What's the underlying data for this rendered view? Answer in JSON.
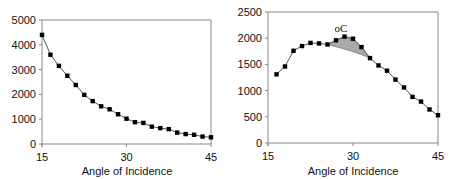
{
  "chart_data": [
    {
      "type": "line",
      "title": "",
      "xlabel": "Angle of Incidence",
      "ylabel": "",
      "xlim": [
        15,
        45
      ],
      "ylim": [
        0,
        5000
      ],
      "xticks": [
        15,
        30,
        45
      ],
      "yticks": [
        0,
        1000,
        2000,
        3000,
        4000,
        5000
      ],
      "grid": false,
      "legend": null,
      "x": [
        15,
        16.5,
        18,
        19.5,
        21,
        22.5,
        24,
        25.5,
        27,
        28.5,
        30,
        31.5,
        33,
        34.5,
        36,
        37.5,
        39,
        40.5,
        42,
        43.5,
        45
      ],
      "values": [
        4400,
        3600,
        3150,
        2750,
        2380,
        1980,
        1730,
        1520,
        1400,
        1200,
        1020,
        880,
        850,
        700,
        640,
        600,
        460,
        400,
        370,
        300,
        270
      ]
    },
    {
      "type": "line",
      "title": "",
      "xlabel": "Angle of Incidence",
      "ylabel": "",
      "xlim": [
        15,
        45
      ],
      "ylim": [
        0,
        2500
      ],
      "xticks": [
        15,
        30,
        45
      ],
      "yticks": [
        0,
        500,
        1000,
        1500,
        2000,
        2500
      ],
      "grid": false,
      "legend": null,
      "annotations": [
        {
          "text": "oC",
          "x": 29.5,
          "y": 2200,
          "note": "shaded region between curve and baseline from ~25.5 to ~33"
        }
      ],
      "x": [
        16.5,
        18,
        19.5,
        21,
        22.5,
        24,
        25.5,
        27,
        28.5,
        30,
        31.5,
        33,
        34.5,
        36,
        37.5,
        39,
        40.5,
        42,
        43.5,
        45
      ],
      "values": [
        1310,
        1460,
        1760,
        1850,
        1910,
        1900,
        1880,
        1960,
        2030,
        1990,
        1830,
        1620,
        1480,
        1380,
        1210,
        1060,
        880,
        790,
        640,
        530
      ]
    }
  ],
  "labels": {
    "left_xlabel": "Angle of Incidence",
    "right_xlabel": "Angle of Incidence",
    "annotation": "oC"
  }
}
